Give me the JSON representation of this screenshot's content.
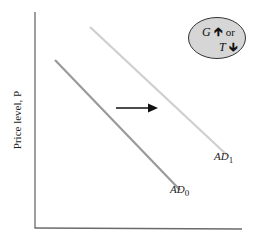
{
  "diagram": {
    "type": "aggregate-demand-shift",
    "y_axis_label": "Price level, P",
    "x_axis_label": "",
    "curves": [
      {
        "name": "AD",
        "subscript": "0",
        "color": "#9a9a9a"
      },
      {
        "name": "AD",
        "subscript": "1",
        "color": "#cfcfcf"
      }
    ],
    "shift_direction": "right",
    "policy_bubble": {
      "line1_var": "G",
      "line1_arrow": "up",
      "line1_conj": "or",
      "line2_var": "T",
      "line2_arrow": "down",
      "fill": "#d6d6d6"
    }
  }
}
